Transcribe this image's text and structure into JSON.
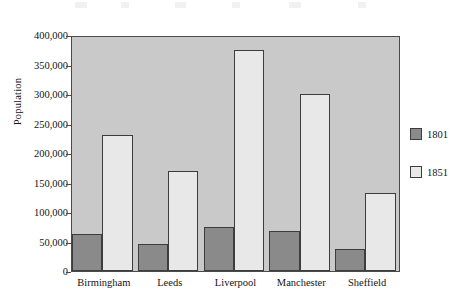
{
  "chart_data": {
    "type": "bar",
    "title": "",
    "subtitle": "",
    "xlabel": "",
    "ylabel": "Population",
    "categories": [
      "Birmingham",
      "Leeds",
      "Liverpool",
      "Manchester",
      "Sheffield"
    ],
    "series": [
      {
        "name": "1801",
        "color": "#8a8a8a",
        "values": [
          62000,
          45000,
          75000,
          67000,
          38000
        ]
      },
      {
        "name": "1851",
        "color": "#e8e8e8",
        "values": [
          230000,
          170000,
          375000,
          300000,
          132000
        ]
      }
    ],
    "ylim": [
      0,
      400000
    ],
    "ytick_values": [
      0,
      50000,
      100000,
      150000,
      200000,
      250000,
      300000,
      350000,
      400000
    ],
    "ytick_labels": [
      "0",
      "50,000",
      "100,000",
      "150,000",
      "200,000",
      "250,000",
      "300,000",
      "350,000",
      "400,000"
    ],
    "grid": false,
    "legend_position": "right",
    "legend_entries": [
      "1801",
      "1851"
    ],
    "plot_background_color": "#c9c9c9",
    "axis_color": "#4a4a4a",
    "bar_border_color": "#3d3d3d"
  }
}
